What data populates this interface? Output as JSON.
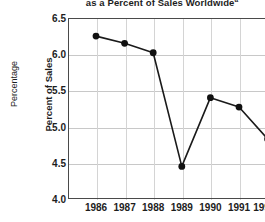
{
  "chart_data": {
    "type": "line",
    "title": "as a Percent of Sales Worldwide",
    "title_superscript": "a",
    "xlabel": "",
    "ylabel": "Percent of Sales",
    "outer_ylabel": "Percentage",
    "categories": [
      "1986",
      "1987",
      "1988",
      "1989",
      "1990",
      "1991",
      "1992E"
    ],
    "values": [
      6.25,
      6.15,
      6.02,
      4.45,
      5.4,
      5.27,
      4.83
    ],
    "ylim": [
      4.0,
      6.5
    ],
    "ytick_labels": [
      "6.5",
      "6.0",
      "5.5",
      "5.0",
      "4.5",
      "4.0"
    ],
    "ytick_values": [
      6.5,
      6.0,
      5.5,
      5.0,
      4.5,
      4.0
    ],
    "grid": true,
    "legend": "none",
    "marker": "filled-circle",
    "line_color": "#1a1a1a",
    "marker_color": "#111111",
    "grid_color": "#c8c8c8",
    "axis_color": "#4a4a4a",
    "background": "#ffffff"
  }
}
